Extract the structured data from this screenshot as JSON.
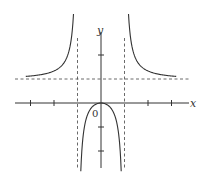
{
  "chart_data": {
    "type": "line",
    "title": "",
    "xlabel": "x",
    "ylabel": "y",
    "origin_label": "0",
    "function_form": "approximately x^2/(x^2-1) (exact equation not confirmed from the image)",
    "xlim": [
      -4,
      4
    ],
    "ylim": [
      -3,
      3
    ],
    "grid": false,
    "legend": "none",
    "x_ticks": [
      -3,
      -2,
      -1,
      1,
      2,
      3
    ],
    "y_ticks": [
      -2,
      -1,
      1,
      2
    ],
    "asymptotes": {
      "vertical": [
        -1,
        1
      ],
      "horizontal": [
        1
      ]
    },
    "series": [
      {
        "name": "left branch (x < -1)",
        "x": [
          -3.2,
          -3,
          -2.5,
          -2,
          -1.6,
          -1.35,
          -1.2
        ],
        "y": [
          1.11,
          1.125,
          1.19,
          1.33,
          1.64,
          2.21,
          3.27
        ]
      },
      {
        "name": "middle branch (-1 < x < 1)",
        "x": [
          -0.85,
          -0.7,
          -0.5,
          -0.3,
          0,
          0.3,
          0.5,
          0.7,
          0.85
        ],
        "y": [
          -2.6,
          -0.96,
          -0.33,
          -0.099,
          0,
          -0.099,
          -0.33,
          -0.96,
          -2.6
        ]
      },
      {
        "name": "right branch (x > 1)",
        "x": [
          1.2,
          1.35,
          1.6,
          2,
          2.5,
          3,
          3.2
        ],
        "y": [
          3.27,
          2.21,
          1.64,
          1.33,
          1.19,
          1.125,
          1.11
        ]
      }
    ]
  }
}
